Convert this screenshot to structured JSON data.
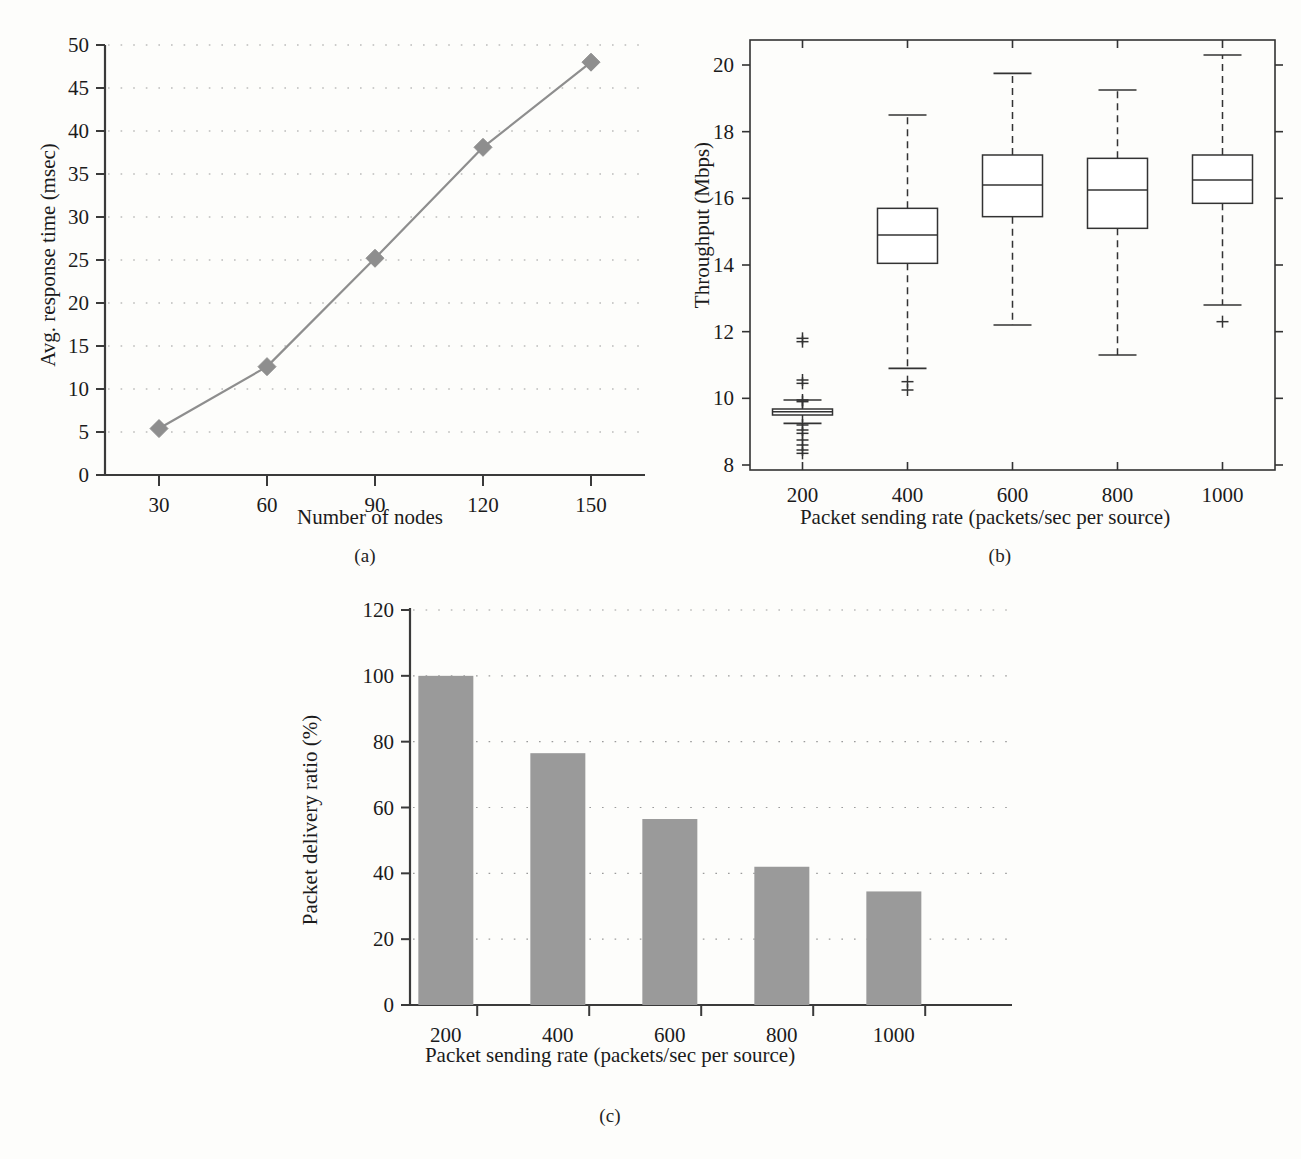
{
  "figure": {
    "panel_captions": [
      "(a)",
      "(b)",
      "(c)"
    ],
    "background_color": "#fdfdfb",
    "text_color": "#1b1b1b"
  },
  "chart_data": [
    {
      "type": "line",
      "panel": "(a)",
      "title": "",
      "xlabel": "Number of nodes",
      "ylabel": "Avg. response time (msec)",
      "categories": [
        "30",
        "60",
        "90",
        "120",
        "150"
      ],
      "x": [
        30,
        60,
        90,
        120,
        150
      ],
      "values": [
        5.4,
        12.6,
        25.2,
        38.1,
        48.0
      ],
      "xtick_labels": [
        "30",
        "60",
        "90",
        "120",
        "150"
      ],
      "ytick_labels": [
        "0",
        "5",
        "10",
        "15",
        "20",
        "25",
        "30",
        "35",
        "40",
        "45",
        "50"
      ],
      "yticks": [
        0,
        5,
        10,
        15,
        20,
        25,
        30,
        35,
        40,
        45,
        50
      ],
      "ylim": [
        0,
        50
      ],
      "xlim": [
        15,
        165
      ],
      "grid": "horizontal-dotted",
      "legend": "none",
      "series_color": "#8e8e8e",
      "marker": "diamond"
    },
    {
      "type": "box",
      "panel": "(b)",
      "title": "",
      "xlabel": "Packet sending rate (packets/sec per source)",
      "ylabel": "Throughput (Mbps)",
      "categories": [
        "200",
        "400",
        "600",
        "800",
        "1000"
      ],
      "xtick_labels": [
        "200",
        "400",
        "600",
        "800",
        "1000"
      ],
      "ytick_labels": [
        "8",
        "10",
        "12",
        "14",
        "16",
        "18",
        "20"
      ],
      "yticks": [
        8,
        10,
        12,
        14,
        16,
        18,
        20
      ],
      "ylim": [
        7.85,
        20.75
      ],
      "grid": "off",
      "legend": "none",
      "box_color": "#333333",
      "boxes": [
        {
          "category": "200",
          "whisker_low": 9.25,
          "q1": 9.5,
          "median": 9.6,
          "q3": 9.68,
          "whisker_high": 9.95,
          "outliers": [
            11.8,
            11.7,
            10.55,
            10.45,
            9.95,
            9.9,
            9.2,
            9.05,
            8.95,
            8.75,
            8.6,
            8.45,
            8.35
          ]
        },
        {
          "category": "400",
          "whisker_low": 10.9,
          "q1": 14.05,
          "median": 14.9,
          "q3": 15.7,
          "whisker_high": 18.5,
          "outliers": [
            10.5,
            10.25
          ]
        },
        {
          "category": "600",
          "whisker_low": 12.2,
          "q1": 15.45,
          "median": 16.4,
          "q3": 17.3,
          "whisker_high": 19.75,
          "outliers": []
        },
        {
          "category": "800",
          "whisker_low": 11.3,
          "q1": 15.1,
          "median": 16.25,
          "q3": 17.2,
          "whisker_high": 19.25,
          "outliers": []
        },
        {
          "category": "1000",
          "whisker_low": 12.8,
          "q1": 15.85,
          "median": 16.55,
          "q3": 17.3,
          "whisker_high": 20.3,
          "outliers": [
            12.3
          ]
        }
      ]
    },
    {
      "type": "bar",
      "panel": "(c)",
      "title": "",
      "xlabel": "Packet sending rate (packets/sec per source)",
      "ylabel": "Packet delivery ratio (%)",
      "categories": [
        "200",
        "400",
        "600",
        "800",
        "1000"
      ],
      "values": [
        100,
        76.5,
        56.5,
        42,
        34.5
      ],
      "xtick_labels": [
        "200",
        "400",
        "600",
        "800",
        "1000"
      ],
      "ytick_labels": [
        "0",
        "20",
        "40",
        "60",
        "80",
        "100",
        "120"
      ],
      "yticks": [
        0,
        20,
        40,
        60,
        80,
        100,
        120
      ],
      "ylim": [
        0,
        120
      ],
      "grid": "horizontal-dotted",
      "legend": "none",
      "bar_color": "#9a9a9a"
    }
  ]
}
